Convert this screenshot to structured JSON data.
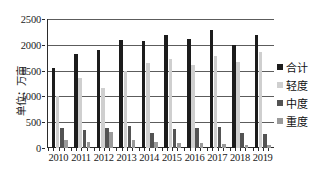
{
  "chart_data": {
    "type": "bar",
    "title": "",
    "xlabel": "",
    "ylabel": "单位：万亩",
    "ylim": [
      0,
      2500
    ],
    "ytick_labels": [
      "2500",
      "2000",
      "1500",
      "1000",
      "500",
      "0"
    ],
    "ytick_values": [
      2500,
      2000,
      1500,
      1000,
      500,
      0
    ],
    "grid": true,
    "legend_position": "right",
    "categories": [
      "2010",
      "2011",
      "2012",
      "2013",
      "2014",
      "2015",
      "2016",
      "2017",
      "2018",
      "2019"
    ],
    "series": [
      {
        "name": "合计",
        "color": "#1c1c1c",
        "values": [
          1560,
          1825,
          1890,
          2095,
          2070,
          2190,
          2110,
          2285,
          2005,
          2195
        ]
      },
      {
        "name": "轻度",
        "color": "#cfcfcf",
        "values": [
          1010,
          1355,
          1170,
          1500,
          1640,
          1720,
          1615,
          1790,
          1670,
          1870
        ]
      },
      {
        "name": "中度",
        "color": "#535353",
        "values": [
          380,
          340,
          390,
          430,
          290,
          365,
          390,
          410,
          285,
          275
        ]
      },
      {
        "name": "重度",
        "color": "#9a9a9a",
        "values": [
          165,
          110,
          315,
          160,
          125,
          95,
          95,
          85,
          50,
          55
        ]
      }
    ]
  },
  "legend": {
    "items": [
      {
        "label": "合计"
      },
      {
        "label": "轻度"
      },
      {
        "label": "中度"
      },
      {
        "label": "重度"
      }
    ]
  }
}
